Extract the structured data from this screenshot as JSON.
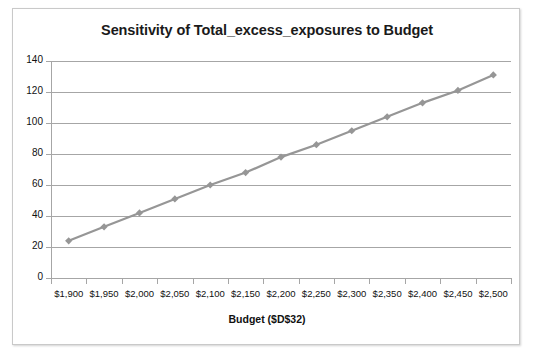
{
  "chart_data": {
    "type": "line",
    "title": "Sensitivity of Total_excess_exposures to Budget",
    "xlabel": "Budget ($D$32)",
    "ylabel": "",
    "categories": [
      "$1,900",
      "$1,950",
      "$2,000",
      "$2,050",
      "$2,100",
      "$2,150",
      "$2,200",
      "$2,250",
      "$2,300",
      "$2,350",
      "$2,400",
      "$2,450",
      "$2,500"
    ],
    "x": [
      1900,
      1950,
      2000,
      2050,
      2100,
      2150,
      2200,
      2250,
      2300,
      2350,
      2400,
      2450,
      2500
    ],
    "values": [
      24,
      33,
      42,
      51,
      60,
      68,
      78,
      86,
      95,
      104,
      113,
      121,
      131
    ],
    "series": [
      {
        "name": "Total_excess_exposures",
        "values": [
          24,
          33,
          42,
          51,
          60,
          68,
          78,
          86,
          95,
          104,
          113,
          121,
          131
        ],
        "color": "#969696",
        "marker": "diamond"
      }
    ],
    "ylim": [
      0,
      140
    ],
    "ytick_labels": [
      "0",
      "20",
      "40",
      "60",
      "80",
      "100",
      "120",
      "140"
    ],
    "yticks": [
      0,
      20,
      40,
      60,
      80,
      100,
      120,
      140
    ],
    "grid": "horizontal",
    "legend": "none",
    "plot_background": "#ffffff",
    "gridline_color": "#a6a6a6",
    "border_color": "#c9c9c9"
  }
}
